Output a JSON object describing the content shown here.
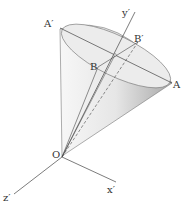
{
  "labels": {
    "A_prime": "A′",
    "A": "A",
    "B": "B",
    "B_prime": "B′",
    "O": "O",
    "y_prime": "y′",
    "x_prime": "x′",
    "z_prime": "z′"
  },
  "colors": {
    "cone_light": "#f2f2f2",
    "cone_shadow": "#bdbdbd",
    "lines": "#444444"
  }
}
